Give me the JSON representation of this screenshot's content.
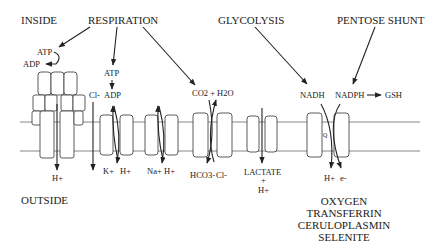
{
  "labels": {
    "inside": "INSIDE",
    "outside": "OUTSIDE",
    "respiration": "RESPIRATION",
    "glycolysis": "GLYCOLYSIS",
    "pentose_shunt": "PENTOSE SHUNT"
  },
  "atp_synthase": {
    "atp": "ATP",
    "adp": "ADP",
    "ion_out": "H+"
  },
  "chloride_channel": {
    "ion": "Cl-"
  },
  "k_h_pump": {
    "atp": "ATP",
    "adp": "ADP",
    "ion1": "K+",
    "ion2": "H+"
  },
  "na_h_exchanger": {
    "ion1": "Na+",
    "ion2": "H+"
  },
  "anion_exchanger": {
    "top": "CO2 + H2O",
    "ion1": "HCO3-",
    "ion2": "Cl-"
  },
  "lactate_transporter": {
    "line1": "LACTATE",
    "line2": "+",
    "line3": "H+"
  },
  "redox_system": {
    "nadh": "NADH",
    "nadph": "NADPH",
    "gsh": "GSH",
    "q": "Q",
    "ion1": "H+",
    "ion2": "e-"
  },
  "acceptors": [
    "OXYGEN",
    "TRANSFERRIN",
    "CERULOPLASMIN",
    "SELENITE"
  ]
}
